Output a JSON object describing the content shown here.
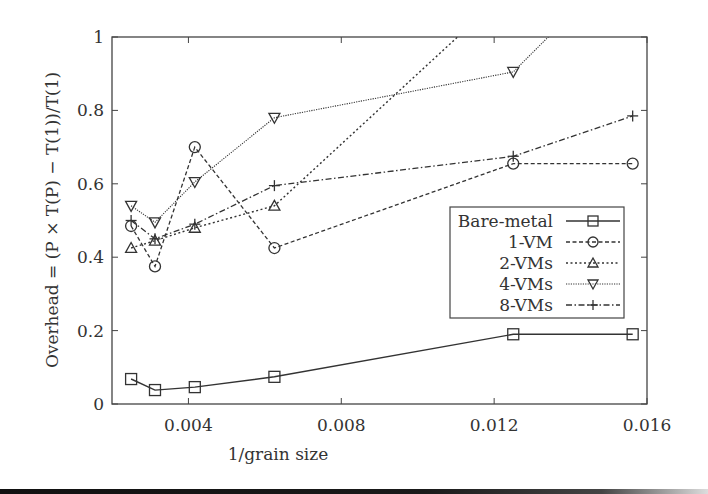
{
  "chart_data": {
    "type": "line",
    "title": "",
    "xlabel": "1/grain size",
    "ylabel": "Overhead = (P × T(P) − T(1))/T(1)",
    "xlim": [
      0.002,
      0.016
    ],
    "ylim": [
      0,
      1
    ],
    "x_ticks": [
      0.004,
      0.008,
      0.012,
      0.016
    ],
    "x_tick_labels": [
      "0.004",
      "0.008",
      "0.012",
      "0.016"
    ],
    "y_ticks": [
      0,
      0.2,
      0.4,
      0.6,
      0.8,
      1
    ],
    "y_tick_labels": [
      "0",
      "0.2",
      "0.4",
      "0.6",
      "0.8",
      "1"
    ],
    "grid": false,
    "legend_position": "right-middle inside",
    "x": [
      0.0025,
      0.003125,
      0.004167,
      0.00625,
      0.0125,
      0.015625
    ],
    "series": [
      {
        "name": "Bare-metal",
        "marker": "square",
        "dash": "solid",
        "values": [
          0.068,
          0.038,
          0.046,
          0.074,
          0.19,
          0.19
        ]
      },
      {
        "name": "1-VM",
        "marker": "circle",
        "dash": "dashed",
        "values": [
          0.485,
          0.375,
          0.7,
          0.425,
          0.655,
          0.655
        ]
      },
      {
        "name": "2-VMs",
        "marker": "triangle-up",
        "dash": "dotted",
        "values": [
          0.425,
          0.445,
          0.48,
          0.54,
          1.14,
          1.2
        ]
      },
      {
        "name": "4-VMs",
        "marker": "triangle-down",
        "dash": "fine-dotted",
        "values": [
          0.54,
          0.495,
          0.605,
          0.78,
          0.905,
          1.23
        ]
      },
      {
        "name": "8-VMs",
        "marker": "plus",
        "dash": "dash-dot",
        "values": [
          0.5,
          0.45,
          0.49,
          0.595,
          0.675,
          0.785
        ]
      }
    ]
  },
  "legend": {
    "entries": [
      "Bare-metal",
      "1-VM",
      "2-VMs",
      "4-VMs",
      "8-VMs"
    ]
  }
}
